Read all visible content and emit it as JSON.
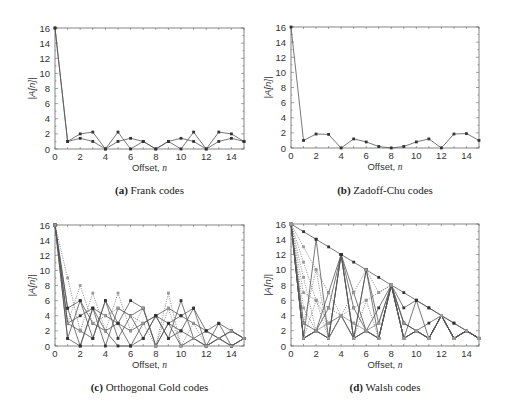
{
  "chart_data": [
    {
      "id": "a",
      "type": "line",
      "label": "(a)",
      "caption": "Frank codes",
      "xlabel": "Offset, n",
      "ylabel": "|A[n]|",
      "xlim": [
        0,
        15
      ],
      "ylim": [
        0,
        16
      ],
      "xticks": [
        0,
        2,
        4,
        6,
        8,
        10,
        12,
        14
      ],
      "yticks": [
        0,
        2,
        4,
        6,
        8,
        10,
        12,
        14,
        16
      ],
      "x": [
        0,
        1,
        2,
        3,
        4,
        5,
        6,
        7,
        8,
        9,
        10,
        11,
        12,
        13,
        14,
        15
      ],
      "series": [
        {
          "name": "code 1",
          "style": "solid",
          "values": [
            16,
            1,
            2,
            2.24,
            0,
            2.24,
            0,
            1,
            0,
            1,
            0,
            2.24,
            0,
            2.24,
            2,
            1
          ]
        },
        {
          "name": "code 2",
          "style": "solid",
          "values": [
            16,
            1,
            1.41,
            1,
            0,
            1,
            1.41,
            1,
            0,
            1,
            1.41,
            1,
            0,
            1,
            1.41,
            1
          ]
        }
      ]
    },
    {
      "id": "b",
      "type": "line",
      "label": "(b)",
      "caption": "Zadoff-Chu codes",
      "xlabel": "Offset, n",
      "ylabel": "|A[n]|",
      "xlim": [
        0,
        15
      ],
      "ylim": [
        0,
        16
      ],
      "xticks": [
        0,
        2,
        4,
        6,
        8,
        10,
        12,
        14
      ],
      "yticks": [
        0,
        2,
        4,
        6,
        8,
        10,
        12,
        14,
        16
      ],
      "x": [
        0,
        1,
        2,
        3,
        4,
        5,
        6,
        7,
        8,
        9,
        10,
        11,
        12,
        13,
        14,
        15
      ],
      "series": [
        {
          "name": "code 1",
          "style": "solid",
          "values": [
            16,
            1,
            1.85,
            1.8,
            0,
            1.2,
            0.8,
            0.2,
            0,
            0.2,
            0.8,
            1.2,
            0,
            1.85,
            1.9,
            1
          ]
        }
      ]
    },
    {
      "id": "c",
      "type": "line",
      "label": "(c)",
      "caption": "Orthogonal Gold codes",
      "xlabel": "Offset, n",
      "ylabel": "|A[n]|",
      "xlim": [
        0,
        15
      ],
      "ylim": [
        0,
        16
      ],
      "xticks": [
        0,
        2,
        4,
        6,
        8,
        10,
        12,
        14
      ],
      "yticks": [
        0,
        2,
        4,
        6,
        8,
        10,
        12,
        14,
        16
      ],
      "x": [
        0,
        1,
        2,
        3,
        4,
        5,
        6,
        7,
        8,
        9,
        10,
        11,
        12,
        13,
        14,
        15
      ],
      "series": [
        {
          "name": "code 1",
          "style": "solid",
          "values": [
            16,
            5,
            6,
            1,
            6,
            1,
            4,
            5,
            0,
            3,
            4,
            5,
            0,
            3,
            0,
            1
          ]
        },
        {
          "name": "code 2",
          "style": "solid",
          "values": [
            16,
            1,
            0,
            5,
            4,
            3,
            0,
            3,
            4,
            1,
            6,
            1,
            2,
            1,
            2,
            1
          ]
        },
        {
          "name": "code 3",
          "style": "solid",
          "values": [
            16,
            3,
            4,
            5,
            0,
            5,
            4,
            1,
            4,
            3,
            2,
            5,
            2,
            3,
            2,
            1
          ]
        },
        {
          "name": "code 4",
          "style": "solid",
          "values": [
            16,
            1,
            6,
            3,
            2,
            3,
            6,
            5,
            0,
            3,
            0,
            1,
            0,
            1,
            0,
            1
          ]
        },
        {
          "name": "code 5",
          "style": "solid",
          "values": [
            16,
            3,
            2,
            1,
            6,
            3,
            2,
            3,
            4,
            5,
            4,
            3,
            2,
            1,
            0,
            1
          ]
        },
        {
          "name": "code 6",
          "style": "solid",
          "values": [
            16,
            5,
            0,
            5,
            2,
            0,
            0,
            1,
            4,
            1,
            2,
            1,
            0,
            1,
            2,
            1
          ]
        },
        {
          "name": "code 7",
          "style": "dotted",
          "values": [
            16,
            9,
            2,
            7,
            2,
            7,
            2,
            5,
            0,
            7,
            0,
            1,
            0,
            1,
            0,
            1
          ]
        },
        {
          "name": "code 8",
          "style": "dotted",
          "values": [
            16,
            3,
            8,
            3,
            4,
            5,
            4,
            3,
            0,
            5,
            0,
            3,
            0,
            1,
            2,
            1
          ]
        }
      ]
    },
    {
      "id": "d",
      "type": "line",
      "label": "(d)",
      "caption": "Walsh codes",
      "xlabel": "Offset, n",
      "ylabel": "|A[n]|",
      "xlim": [
        0,
        15
      ],
      "ylim": [
        0,
        16
      ],
      "xticks": [
        0,
        2,
        4,
        6,
        8,
        10,
        12,
        14
      ],
      "yticks": [
        0,
        2,
        4,
        6,
        8,
        10,
        12,
        14,
        16
      ],
      "x": [
        0,
        1,
        2,
        3,
        4,
        5,
        6,
        7,
        8,
        9,
        10,
        11,
        12,
        13,
        14,
        15
      ],
      "series": [
        {
          "name": "W0",
          "style": "solid",
          "values": [
            16,
            15,
            14,
            13,
            12,
            11,
            10,
            9,
            8,
            7,
            6,
            5,
            4,
            3,
            2,
            1
          ]
        },
        {
          "name": "W1",
          "style": "solid",
          "values": [
            16,
            1,
            14,
            1,
            12,
            1,
            10,
            1,
            8,
            1,
            6,
            1,
            4,
            1,
            2,
            1
          ]
        },
        {
          "name": "W2",
          "style": "solid",
          "values": [
            16,
            1,
            2,
            1,
            12,
            1,
            2,
            1,
            8,
            1,
            2,
            1,
            4,
            1,
            2,
            1
          ]
        },
        {
          "name": "W3",
          "style": "solid",
          "values": [
            16,
            1,
            2,
            7,
            12,
            7,
            2,
            1,
            8,
            3,
            2,
            3,
            4,
            1,
            2,
            1
          ]
        },
        {
          "name": "W4",
          "style": "solid",
          "values": [
            16,
            1,
            2,
            5,
            12,
            5,
            2,
            1,
            8,
            5,
            6,
            5,
            4,
            3,
            2,
            1
          ]
        },
        {
          "name": "W5",
          "style": "solid",
          "values": [
            16,
            1,
            2,
            1,
            4,
            1,
            2,
            5,
            8,
            3,
            2,
            1,
            4,
            1,
            2,
            1
          ]
        },
        {
          "name": "W6",
          "style": "solid",
          "values": [
            16,
            3,
            2,
            1,
            12,
            1,
            10,
            3,
            8,
            1,
            2,
            1,
            4,
            1,
            2,
            1
          ]
        },
        {
          "name": "W7",
          "style": "dotted",
          "values": [
            16,
            13,
            10,
            7,
            4,
            7,
            10,
            7,
            8,
            1,
            2,
            1,
            4,
            1,
            2,
            1
          ]
        },
        {
          "name": "W8",
          "style": "dotted",
          "values": [
            16,
            11,
            6,
            1,
            4,
            1,
            6,
            1,
            8,
            1,
            2,
            1,
            4,
            1,
            2,
            1
          ]
        },
        {
          "name": "W9",
          "style": "dotted",
          "values": [
            16,
            9,
            2,
            3,
            4,
            3,
            2,
            3,
            8,
            1,
            2,
            1,
            4,
            1,
            2,
            1
          ]
        },
        {
          "name": "W10",
          "style": "dotted",
          "values": [
            16,
            7,
            6,
            5,
            4,
            3,
            2,
            3,
            8,
            1,
            2,
            1,
            4,
            1,
            2,
            1
          ]
        },
        {
          "name": "W11",
          "style": "dotted",
          "values": [
            16,
            5,
            2,
            3,
            4,
            5,
            6,
            7,
            8,
            1,
            2,
            1,
            4,
            1,
            2,
            1
          ]
        },
        {
          "name": "W12",
          "style": "dotted",
          "values": [
            16,
            3,
            10,
            1,
            4,
            1,
            2,
            1,
            8,
            1,
            2,
            1,
            4,
            1,
            2,
            1
          ]
        },
        {
          "name": "W13",
          "style": "dotted",
          "values": [
            16,
            1,
            6,
            3,
            4,
            1,
            2,
            1,
            8,
            3,
            2,
            1,
            4,
            1,
            2,
            1
          ]
        }
      ]
    }
  ],
  "panels": {
    "a": {
      "label": "(a)",
      "caption": "Frank codes"
    },
    "b": {
      "label": "(b)",
      "caption": "Zadoff-Chu codes"
    },
    "c": {
      "label": "(c)",
      "caption": "Orthogonal Gold codes"
    },
    "d": {
      "label": "(d)",
      "caption": "Walsh codes"
    }
  },
  "colors": {
    "line": "#555555",
    "marker": "#333333",
    "frame": "#666666",
    "text": "#333333"
  }
}
